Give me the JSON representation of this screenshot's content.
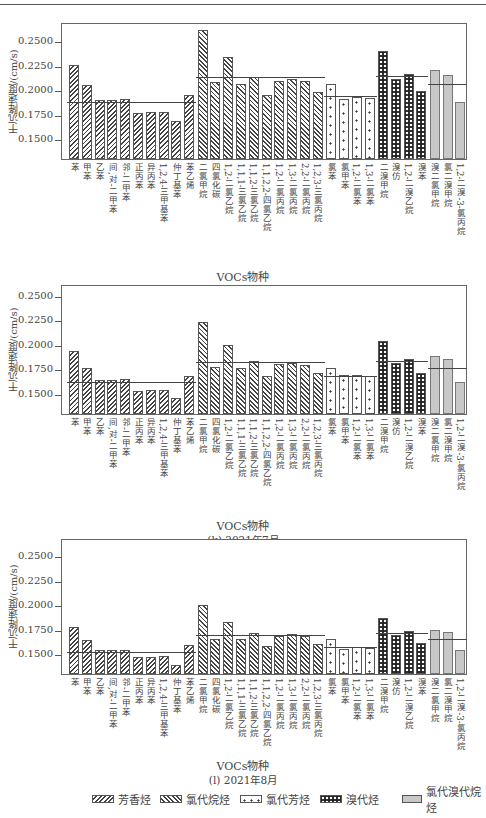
{
  "ylabel": "干沉降速度/(cm/s)",
  "xlabel": "VOCs物种",
  "species": [
    "苯",
    "甲苯",
    "乙苯",
    "间,对-二甲苯",
    "邻-二甲苯",
    "正丙苯",
    "异丙苯",
    "1,2,4-三甲基苯",
    "仲丁基苯",
    "苯乙烯",
    "二氯甲烷",
    "四氯化碳",
    "1,2-二氯乙烷",
    "1,1,1-三氯乙烷",
    "1,1,2-三氯乙烷",
    "1,1,2,2-四氯乙烷",
    "1,2-二氯丙烷",
    "1,3-二氯丙烷",
    "2,2-二氯丙烷",
    "1,2,3-三氯丙烷",
    "氯苯",
    "氯甲苯",
    "1,2-二氯苯",
    "1,3-二氯苯",
    "二溴甲烷",
    "溴仿",
    "1,2-二溴乙烷",
    "溴苯",
    "溴二氯甲烷",
    "氯二溴甲烷",
    "1,2-二溴-3-氯丙烷"
  ],
  "groups": [
    {
      "key": "arom",
      "name": "芳香烃",
      "start": 0,
      "end": 9
    },
    {
      "key": "clalk",
      "name": "氯代烷烃",
      "start": 10,
      "end": 19
    },
    {
      "key": "clar",
      "name": "氯代芳烃",
      "start": 20,
      "end": 23
    },
    {
      "key": "br",
      "name": "溴代烃",
      "start": 24,
      "end": 27
    },
    {
      "key": "clbr",
      "name": "氯代溴代烷烃",
      "start": 28,
      "end": 30
    }
  ],
  "legend": [
    "芳香烃",
    "氯代烷烃",
    "氯代芳烃",
    "溴代烃",
    "氯代溴代烷烃"
  ],
  "chart_data": [
    {
      "type": "bar",
      "title": "(j) 2021年6月",
      "xlabel": "VOCs物种",
      "ylabel": "干沉降速度/(cm/s)",
      "yticks": [
        0.15,
        0.175,
        0.2,
        0.225,
        0.25
      ],
      "ylim": [
        0.1296,
        0.2695
      ],
      "categories_ref": "species",
      "values": [
        0.2255,
        0.205,
        0.19,
        0.19,
        0.191,
        0.1765,
        0.1775,
        0.1775,
        0.168,
        0.195,
        0.261,
        0.208,
        0.234,
        0.206,
        0.213,
        0.195,
        0.209,
        0.211,
        0.209,
        0.198,
        0.206,
        0.191,
        0.193,
        0.192,
        0.24,
        0.211,
        0.216,
        0.199,
        0.221,
        0.215,
        0.188
      ],
      "group_means": {
        "arom": 0.19,
        "clalk": 0.215,
        "clar": 0.196,
        "br": 0.216,
        "clbr": 0.208
      },
      "legend_position": "bottom"
    },
    {
      "type": "bar",
      "title": "(k) 2021年7月",
      "xlabel": "VOCs物种",
      "ylabel": "干沉降速度/(cm/s)",
      "yticks": [
        0.15,
        0.175,
        0.2,
        0.225,
        0.25
      ],
      "ylim": [
        0.1296,
        0.2622
      ],
      "categories_ref": "species",
      "values": [
        0.194,
        0.1765,
        0.1645,
        0.1645,
        0.165,
        0.153,
        0.154,
        0.154,
        0.146,
        0.168,
        0.223,
        0.178,
        0.2,
        0.1765,
        0.1835,
        0.168,
        0.181,
        0.182,
        0.18,
        0.171,
        0.177,
        0.169,
        0.169,
        0.168,
        0.204,
        0.182,
        0.186,
        0.171,
        0.189,
        0.186,
        0.162
      ],
      "group_means": {
        "arom": 0.1645,
        "clalk": 0.185,
        "clar": 0.17,
        "br": 0.186,
        "clbr": 0.179
      },
      "legend_position": "bottom"
    },
    {
      "type": "bar",
      "title": "(l) 2021年8月",
      "xlabel": "VOCs物种",
      "ylabel": "干沉降速度/(cm/s)",
      "yticks": [
        0.15,
        0.175,
        0.2,
        0.225,
        0.25
      ],
      "ylim": [
        0.1296,
        0.2684
      ],
      "categories_ref": "species",
      "values": [
        0.1775,
        0.1645,
        0.1545,
        0.1545,
        0.1545,
        0.1465,
        0.1465,
        0.1475,
        0.139,
        0.159,
        0.2,
        0.165,
        0.183,
        0.165,
        0.171,
        0.158,
        0.168,
        0.17,
        0.168,
        0.16,
        0.165,
        0.155,
        0.157,
        0.156,
        0.187,
        0.169,
        0.173,
        0.161,
        0.175,
        0.172,
        0.154
      ],
      "group_means": {
        "arom": 0.1545,
        "clalk": 0.171,
        "clar": 0.159,
        "br": 0.173,
        "clbr": 0.167
      },
      "legend_position": "bottom"
    }
  ],
  "panels_layout": [
    {
      "frame_top": 23,
      "frame_bottom": 160,
      "y_top_val": 0.2695,
      "xtitle_y": 268,
      "sub_y": 283
    },
    {
      "frame_top": 285,
      "frame_bottom": 415,
      "y_top_val": 0.2622,
      "xtitle_y": 517,
      "sub_y": 532
    },
    {
      "frame_top": 539,
      "frame_bottom": 675,
      "y_top_val": 0.2684,
      "xtitle_y": 757,
      "sub_y": 772
    }
  ]
}
